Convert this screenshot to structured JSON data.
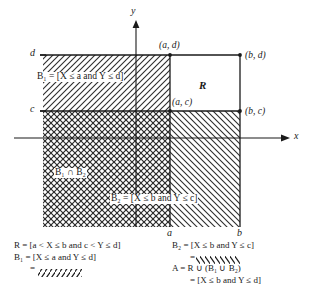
{
  "figure": {
    "axes": {
      "x_label": "x",
      "y_label": "y"
    },
    "ticks": {
      "y_upper": "d",
      "y_lower": "c",
      "x_left": "a",
      "x_right": "b"
    },
    "corner_points": [
      {
        "name": "point-a-d",
        "label": "(a, d)"
      },
      {
        "name": "point-b-d",
        "label": "(b, d)"
      },
      {
        "name": "point-a-c",
        "label": "(a, c)"
      },
      {
        "name": "point-b-c",
        "label": "(b, c)"
      }
    ],
    "region_labels": {
      "rect_R": "R",
      "b1_region": "B₁ = [X ≤ a and Y ≤ d]",
      "b2_region": "B₂ = [X ≤ b and Y ≤ c]",
      "intersection": "B₁ ∩ B₂"
    },
    "colors": {
      "ink": "#1a1a1a",
      "hatch": "#2b2b2b",
      "background": "#ffffff"
    }
  },
  "legend_left": {
    "lines": [
      "R = [a < X ≤ b and c < Y ≤ d]",
      "B₁ = [X ≤ a and Y ≤ d]",
      "="
    ],
    "swatch_name": "forward-hatch-swatch"
  },
  "legend_right": {
    "lines": [
      "B₂ = [X ≤ b and Y ≤ c]",
      "=",
      "A = R ∪ (B₁ ∪ B₂)",
      "= [X ≤ b and Y ≤ d]"
    ],
    "swatch_name": "back-hatch-swatch"
  }
}
